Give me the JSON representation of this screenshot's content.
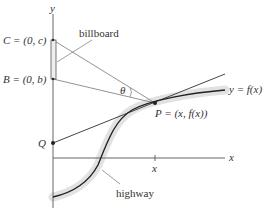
{
  "diagram": {
    "axes": {
      "x_label": "x",
      "y_label": "y",
      "x_tick_label": "x"
    },
    "points": {
      "C": "C = (0, c)",
      "B": "B = (0, b)",
      "P": "P = (x, f(x))",
      "Q": "Q"
    },
    "labels": {
      "billboard": "billboard",
      "highway": "highway",
      "curve": "y = f(x)",
      "angle": "θ"
    },
    "colors": {
      "line": "#333333",
      "highway_band": "#e3e3e3",
      "billboard_fill": "#eeeeee",
      "thin_line": "#666666"
    }
  }
}
